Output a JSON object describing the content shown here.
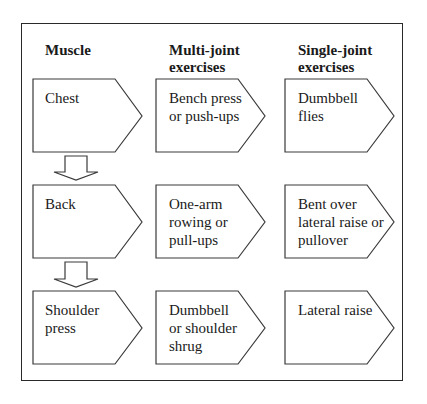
{
  "diagram": {
    "headers": {
      "muscle": "Muscle",
      "multi_joint_line1": "Multi-joint",
      "multi_joint_line2": "exercises",
      "single_joint_line1": "Single-joint",
      "single_joint_line2": "exercises"
    },
    "rows": [
      {
        "muscle": [
          "Chest"
        ],
        "multi_joint": [
          "Bench press",
          "or push-ups"
        ],
        "single_joint": [
          "Dumbbell",
          "flies"
        ]
      },
      {
        "muscle": [
          "Back"
        ],
        "multi_joint": [
          "One-arm",
          "rowing or",
          "pull-ups"
        ],
        "single_joint": [
          "Bent over",
          "lateral raise or",
          "pullover"
        ]
      },
      {
        "muscle": [
          "Shoulder",
          "press"
        ],
        "multi_joint": [
          "Dumbbell",
          "or shoulder",
          "shrug"
        ],
        "single_joint": [
          "Lateral raise"
        ]
      }
    ],
    "colors": {
      "stroke": "#3a3a3a",
      "fill": "#ffffff",
      "text": "#1a1a1a"
    }
  }
}
